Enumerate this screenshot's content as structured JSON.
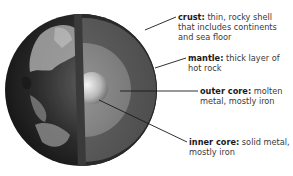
{
  "diagram": {
    "labels": [
      {
        "term": "crust:",
        "desc_line1": " thin, rocky shell",
        "desc_line2": "that includes continents",
        "desc_line3": "and sea floor"
      },
      {
        "term": "mantle:",
        "desc_line1": " thick layer of",
        "desc_line2": "hot rock"
      },
      {
        "term": "outer core:",
        "desc_line1": " molten",
        "desc_line2": "metal, mostly iron"
      },
      {
        "term": "inner core:",
        "desc_line1": " solid metal,",
        "desc_line2": "mostly iron"
      }
    ]
  }
}
